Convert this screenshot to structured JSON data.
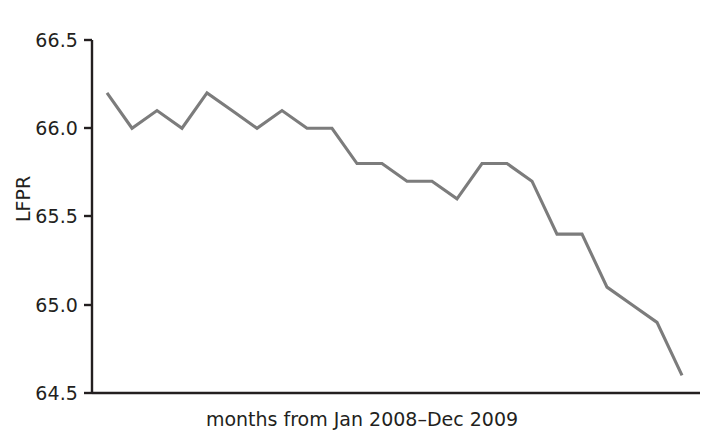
{
  "chart_data": {
    "type": "line",
    "title": "",
    "subtitle": "",
    "xlabel": "months from Jan 2008–Dec 2009",
    "ylabel": "LFPR",
    "ylim": [
      64.5,
      66.5
    ],
    "ytick_labels": [
      "66.5",
      "66.0",
      "65.5",
      "65.0",
      "64.5"
    ],
    "ytick_values": [
      66.5,
      66.0,
      65.5,
      65.0,
      64.5
    ],
    "xtick_labels": [],
    "grid": false,
    "legend": false,
    "legend_position": "none",
    "line_color": "#7c7c7c",
    "axis_color": "#231f20",
    "background": "#ffffff",
    "x": [
      1,
      2,
      3,
      4,
      5,
      6,
      7,
      8,
      9,
      10,
      11,
      12,
      13,
      14,
      15,
      16,
      17,
      18,
      19,
      20,
      21,
      22,
      23,
      24
    ],
    "categories": [
      "Jan 2008",
      "Feb 2008",
      "Mar 2008",
      "Apr 2008",
      "May 2008",
      "Jun 2008",
      "Jul 2008",
      "Aug 2008",
      "Sep 2008",
      "Oct 2008",
      "Nov 2008",
      "Dec 2008",
      "Jan 2009",
      "Feb 2009",
      "Mar 2009",
      "Apr 2009",
      "May 2009",
      "Jun 2009",
      "Jul 2009",
      "Aug 2009",
      "Sep 2009",
      "Oct 2009",
      "Nov 2009",
      "Dec 2009"
    ],
    "series": [
      {
        "name": "LFPR",
        "values": [
          66.2,
          66.0,
          66.1,
          66.0,
          66.2,
          66.1,
          66.0,
          66.1,
          66.0,
          66.0,
          65.8,
          65.8,
          65.7,
          65.7,
          65.6,
          65.8,
          65.8,
          65.7,
          65.4,
          65.4,
          65.1,
          65.0,
          64.9,
          64.6
        ]
      }
    ]
  },
  "axes": {
    "ylabel_text": "LFPR",
    "xlabel_text": "months from Jan 2008–Dec 2009",
    "yticks": [
      {
        "label": "66.5",
        "value": 66.5
      },
      {
        "label": "66.0",
        "value": 66.0
      },
      {
        "label": "65.5",
        "value": 65.5
      },
      {
        "label": "65.0",
        "value": 65.0
      },
      {
        "label": "64.5",
        "value": 64.5
      }
    ]
  }
}
